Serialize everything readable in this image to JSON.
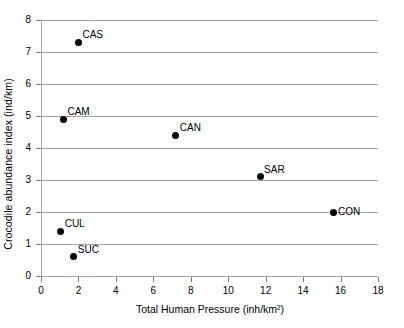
{
  "chart_data": {
    "type": "scatter",
    "title": "",
    "xlabel": "Total Human Pressure (inh/km²)",
    "ylabel": "Crocodile abundance index (ind/km)",
    "xlim": [
      0,
      18
    ],
    "ylim": [
      0,
      8
    ],
    "xticks": [
      0,
      2,
      4,
      6,
      8,
      10,
      12,
      14,
      16,
      18
    ],
    "yticks": [
      0,
      1,
      2,
      3,
      4,
      5,
      6,
      7,
      8
    ],
    "xtick_labels": [
      "0",
      "2",
      "4",
      "6",
      "8",
      "10",
      "12",
      "14",
      "16",
      "18"
    ],
    "ytick_labels": [
      "0",
      "1",
      "2",
      "3",
      "4",
      "5",
      "6",
      "7",
      "8"
    ],
    "grid": "horizontal",
    "legend": "none",
    "marker": "filled-circle",
    "marker_color": "#000000",
    "gridline_color": "#a6a6a6",
    "points": [
      {
        "label": "CAS",
        "x": 2.0,
        "y": 7.3,
        "label_pos": "upper-right"
      },
      {
        "label": "CAM",
        "x": 1.2,
        "y": 4.9,
        "label_pos": "upper-right"
      },
      {
        "label": "CAN",
        "x": 7.2,
        "y": 4.4,
        "label_pos": "upper-right"
      },
      {
        "label": "SAR",
        "x": 11.7,
        "y": 3.1,
        "label_pos": "upper-right"
      },
      {
        "label": "CON",
        "x": 15.6,
        "y": 2.0,
        "label_pos": "right"
      },
      {
        "label": "CUL",
        "x": 1.05,
        "y": 1.4,
        "label_pos": "upper-right"
      },
      {
        "label": "SUC",
        "x": 1.75,
        "y": 0.6,
        "label_pos": "upper-right"
      }
    ]
  }
}
